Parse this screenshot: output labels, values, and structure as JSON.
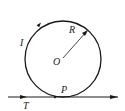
{
  "diagram": {
    "type": "physics-circular-current-loop",
    "labels": {
      "current": "I",
      "radius": "R",
      "center": "O",
      "tangent_point": "P",
      "line": "T"
    },
    "colors": {
      "stroke": "#1a1a1a",
      "background": "#ffffff"
    }
  }
}
